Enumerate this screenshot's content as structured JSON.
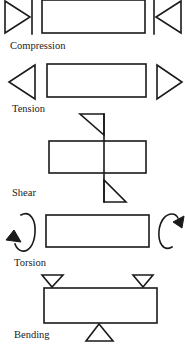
{
  "diagram": {
    "panels": [
      {
        "id": "compression",
        "label": "Compression",
        "description": "Two force triangles pushing inward toward the beam from both ends"
      },
      {
        "id": "tension",
        "label": "Tension",
        "description": "Two force triangles pulling outward away from the beam at both ends"
      },
      {
        "id": "shear",
        "label": "Shear",
        "description": "Vertical line through beam with opposing offset triangles above and below"
      },
      {
        "id": "torsion",
        "label": "Torsion",
        "description": "Curved twisting arrows at each end rotating in opposite directions"
      },
      {
        "id": "bending",
        "label": "Bending",
        "description": "Two load triangles on top near the ends, one support triangle below the center"
      }
    ],
    "colors": {
      "line": "#1a1a1a",
      "background": "#ffffff",
      "text": "#222222"
    }
  }
}
